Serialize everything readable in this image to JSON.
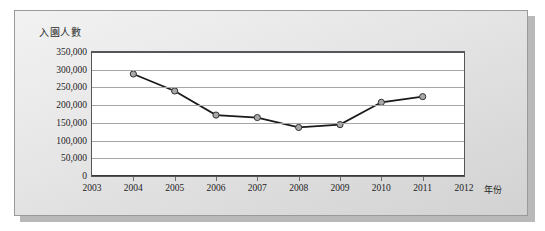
{
  "figure": {
    "background_color": "#e4e4e4",
    "plot_background_color": "#ffffff",
    "frame_border_color": "#9a9a9a",
    "axis_color": "#55565a",
    "gridline_color": "#a6a6a6",
    "line_color": "#1a1a1a",
    "marker_fill_color": "#a8a8a8",
    "marker_edge_color": "#333333"
  },
  "chart_data": {
    "type": "line",
    "title": "",
    "ylabel": "入園人數",
    "xlabel": "年份",
    "x": [
      2003,
      2004,
      2005,
      2006,
      2007,
      2008,
      2009,
      2010,
      2011,
      2012
    ],
    "xtick_labels": [
      "2003",
      "2004",
      "2005",
      "2006",
      "2007",
      "2008",
      "2009",
      "2010",
      "2011",
      "2012"
    ],
    "xlim": [
      2003,
      2012
    ],
    "ylim": [
      0,
      350000
    ],
    "ytick_values": [
      0,
      50000,
      100000,
      150000,
      200000,
      250000,
      300000,
      350000
    ],
    "ytick_labels": [
      "0",
      "50,000",
      "100,000",
      "150,000",
      "200,000",
      "250,000",
      "300,000",
      "350,000"
    ],
    "grid": true,
    "legend": false,
    "legend_position": "none",
    "series": [
      {
        "name": "入園人數",
        "x": [
          2004,
          2005,
          2006,
          2007,
          2008,
          2009,
          2010,
          2011
        ],
        "values": [
          288000,
          240000,
          172000,
          165000,
          137000,
          145000,
          208000,
          224000
        ],
        "marker": "circle",
        "line_style": "solid"
      }
    ]
  }
}
